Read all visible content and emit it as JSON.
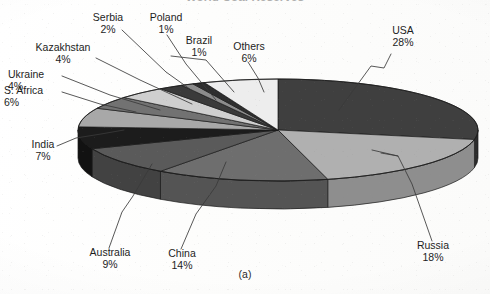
{
  "figure": {
    "title": "World Coal Reserves",
    "caption": "(a)",
    "background_color": "#ffffff"
  },
  "chart_data": {
    "type": "pie",
    "title": "World Coal Reserves",
    "subtitle": "",
    "xlabel": "",
    "ylabel": "",
    "style": "3d-exploded-disc",
    "grid": false,
    "legend": "none",
    "label_format": "name + percent",
    "units": "percent",
    "total": 100,
    "categories": [
      "USA",
      "Russia",
      "China",
      "Australia",
      "India",
      "S. Africa",
      "Ukraine",
      "Kazakhstan",
      "Serbia",
      "Poland",
      "Brazil",
      "Others"
    ],
    "values": [
      28,
      18,
      14,
      9,
      7,
      6,
      4,
      4,
      2,
      1,
      1,
      6
    ],
    "slices": [
      {
        "label": "USA",
        "percent": 28,
        "percent_text": "28%",
        "fill": "#3f3f3f",
        "side_fill": "#2c2c2c"
      },
      {
        "label": "Russia",
        "percent": 18,
        "percent_text": "18%",
        "fill": "#b0b0b0",
        "side_fill": "#8e8e8e"
      },
      {
        "label": "China",
        "percent": 14,
        "percent_text": "14%",
        "fill": "#6e6e6e",
        "side_fill": "#545454"
      },
      {
        "label": "Australia",
        "percent": 9,
        "percent_text": "9%",
        "fill": "#5a5a5a",
        "side_fill": "#424242"
      },
      {
        "label": "India",
        "percent": 7,
        "percent_text": "7%",
        "fill": "#1c1c1c",
        "side_fill": "#121212"
      },
      {
        "label": "S. Africa",
        "percent": 6,
        "percent_text": "6%",
        "fill": "#a8a8a8",
        "side_fill": "#868686"
      },
      {
        "label": "Ukraine",
        "percent": 4,
        "percent_text": "4%",
        "fill": "#727272",
        "side_fill": "#565656"
      },
      {
        "label": "Kazakhstan",
        "percent": 4,
        "percent_text": "4%",
        "fill": "#cfcfcf",
        "side_fill": "#a9a9a9"
      },
      {
        "label": "Serbia",
        "percent": 2,
        "percent_text": "2%",
        "fill": "#3a3a3a",
        "side_fill": "#282828"
      },
      {
        "label": "Poland",
        "percent": 1,
        "percent_text": "1%",
        "fill": "#8c8c8c",
        "side_fill": "#6c6c6c"
      },
      {
        "label": "Brazil",
        "percent": 1,
        "percent_text": "1%",
        "fill": "#2e2e2e",
        "side_fill": "#1f1f1f"
      },
      {
        "label": "Others",
        "percent": 6,
        "percent_text": "6%",
        "fill": "#ededed",
        "side_fill": "#c8c8c8"
      }
    ],
    "callouts": [
      {
        "label": "USA",
        "percent_text": "28%"
      },
      {
        "label": "Russia",
        "percent_text": "18%"
      },
      {
        "label": "China",
        "percent_text": "14%"
      },
      {
        "label": "Australia",
        "percent_text": "9%"
      },
      {
        "label": "India",
        "percent_text": "7%"
      },
      {
        "label": "S. Africa",
        "percent_text": "6%"
      },
      {
        "label": "Ukraine",
        "percent_text": "4%"
      },
      {
        "label": "Kazakhstan",
        "percent_text": "4%"
      },
      {
        "label": "Serbia",
        "percent_text": "2%"
      },
      {
        "label": "Poland",
        "percent_text": "1%"
      },
      {
        "label": "Brazil",
        "percent_text": "1%"
      },
      {
        "label": "Others",
        "percent_text": "6%"
      }
    ]
  }
}
